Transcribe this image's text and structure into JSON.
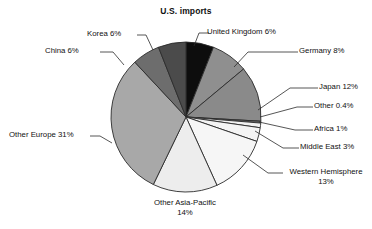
{
  "chart_data": {
    "type": "pie",
    "title": "U.S. imports",
    "xlabel": "",
    "ylabel": "",
    "legend_position": "none",
    "grid": false,
    "value_unit": "percent",
    "categories": [
      "United Kingdom",
      "Germany",
      "Japan",
      "Other",
      "Africa",
      "Middle East",
      "Western Hemisphere",
      "Other Asia-Pacific",
      "Other Europe",
      "China",
      "Korea"
    ],
    "values": [
      6,
      8,
      12,
      0.4,
      1,
      3,
      13,
      14,
      31,
      6,
      6
    ],
    "slices": [
      {
        "label": "United Kingdom 6%",
        "name": "United Kingdom",
        "value": 6,
        "color": "#0d0d0d"
      },
      {
        "label": "Germany 8%",
        "name": "Germany",
        "value": 8,
        "color": "#8f8f8f"
      },
      {
        "label": "Japan 12%",
        "name": "Japan",
        "value": 12,
        "color": "#8a8a8a"
      },
      {
        "label": "Other 0.4%",
        "name": "Other",
        "value": 0.4,
        "color": "#6e6e6e"
      },
      {
        "label": "Africa 1%",
        "name": "Africa",
        "value": 1,
        "color": "#f2f2f2"
      },
      {
        "label": "Middle East 3%",
        "name": "Middle East",
        "value": 3,
        "color": "#f4f4f4"
      },
      {
        "label": "Western Hemisphere 13%",
        "name": "Western Hemisphere",
        "value": 13,
        "color": "#f6f6f6"
      },
      {
        "label": "Other Asia-Pacific 14%",
        "name": "Other Asia-Pacific",
        "value": 14,
        "color": "#ededed"
      },
      {
        "label": "Other Europe 31%",
        "name": "Other Europe",
        "value": 31,
        "color": "#a8a8a8"
      },
      {
        "label": "China 6%",
        "name": "China",
        "value": 6,
        "color": "#6d6d6d"
      },
      {
        "label": "Korea 6%",
        "name": "Korea",
        "value": 6,
        "color": "#4b4b4b"
      }
    ],
    "labels": {
      "united_kingdom": "United Kingdom 6%",
      "germany": "Germany 8%",
      "japan": "Japan 12%",
      "other": "Other 0.4%",
      "africa": "Africa 1%",
      "middle_east": "Middle East 3%",
      "western_hemisphere_line1": "Western Hemisphere",
      "western_hemisphere_line2": "13%",
      "other_asia_pacific_line1": "Other Asia-Pacific",
      "other_asia_pacific_line2": "14%",
      "other_europe": "Other Europe 31%",
      "china": "China 6%",
      "korea": "Korea 6%"
    }
  }
}
